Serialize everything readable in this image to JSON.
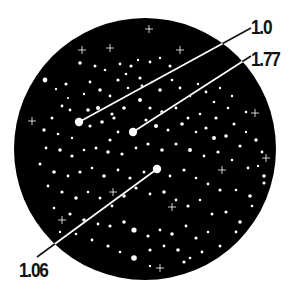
{
  "diagram": {
    "background": "#ffffff",
    "field": {
      "cx": 145,
      "cy": 149,
      "r": 131,
      "color": "#000000"
    },
    "star_color": "#ffffff",
    "line_color_outside": "#111111",
    "line_color_inside": "#ffffff",
    "callouts": [
      {
        "label": "1.0",
        "star": [
          79,
          122
        ],
        "anchor": [
          251,
          28
        ],
        "label_pos": [
          251,
          16
        ]
      },
      {
        "label": "1.77",
        "star": [
          133,
          132
        ],
        "anchor": [
          251,
          56
        ],
        "label_pos": [
          251,
          48
        ]
      },
      {
        "label": "1.06",
        "star": [
          157,
          169
        ],
        "anchor": [
          37,
          257
        ],
        "label_pos": [
          19,
          259
        ]
      }
    ],
    "highlight_stars": [
      [
        79,
        122,
        4.2
      ],
      [
        133,
        132,
        4.2
      ],
      [
        157,
        169,
        4.2
      ]
    ],
    "sparkles": [
      [
        149,
        29
      ],
      [
        110,
        48
      ],
      [
        180,
        50
      ],
      [
        82,
        50
      ],
      [
        32,
        121
      ],
      [
        62,
        220
      ],
      [
        172,
        207
      ],
      [
        255,
        113
      ],
      [
        113,
        192
      ],
      [
        222,
        170
      ],
      [
        266,
        158
      ],
      [
        160,
        268
      ]
    ],
    "stars": [
      [
        45,
        80,
        2.4
      ],
      [
        66,
        84,
        1.6
      ],
      [
        80,
        63,
        1.8
      ],
      [
        95,
        66,
        1.5
      ],
      [
        105,
        70,
        1.3
      ],
      [
        120,
        64,
        1.4
      ],
      [
        131,
        66,
        1.6
      ],
      [
        138,
        60,
        1.2
      ],
      [
        150,
        62,
        1.4
      ],
      [
        160,
        58,
        1.2
      ],
      [
        170,
        66,
        1.5
      ],
      [
        56,
        89,
        1.2
      ],
      [
        68,
        98,
        1.1
      ],
      [
        70,
        110,
        1.4
      ],
      [
        90,
        82,
        1.4
      ],
      [
        100,
        90,
        1.8
      ],
      [
        110,
        96,
        1.4
      ],
      [
        118,
        80,
        1.6
      ],
      [
        128,
        88,
        1.3
      ],
      [
        140,
        78,
        1.6
      ],
      [
        152,
        82,
        1.2
      ],
      [
        160,
        90,
        1.8
      ],
      [
        172,
        80,
        1.3
      ],
      [
        180,
        88,
        1.4
      ],
      [
        190,
        96,
        1.3
      ],
      [
        198,
        84,
        1.2
      ],
      [
        206,
        92,
        1.4
      ],
      [
        214,
        102,
        1.3
      ],
      [
        220,
        88,
        1.2
      ],
      [
        62,
        106,
        1.4
      ],
      [
        52,
        118,
        1.5
      ],
      [
        44,
        130,
        1.7
      ],
      [
        58,
        134,
        1.3
      ],
      [
        72,
        138,
        1.2
      ],
      [
        88,
        110,
        1.8
      ],
      [
        98,
        108,
        2.0
      ],
      [
        112,
        114,
        1.6
      ],
      [
        124,
        108,
        1.8
      ],
      [
        140,
        100,
        2.0
      ],
      [
        150,
        108,
        1.6
      ],
      [
        162,
        112,
        1.8
      ],
      [
        176,
        108,
        1.4
      ],
      [
        188,
        118,
        1.5
      ],
      [
        200,
        114,
        1.3
      ],
      [
        216,
        118,
        1.6
      ],
      [
        228,
        108,
        1.3
      ],
      [
        234,
        124,
        1.5
      ],
      [
        246,
        132,
        1.2
      ],
      [
        90,
        126,
        1.6
      ],
      [
        102,
        122,
        1.8
      ],
      [
        114,
        118,
        1.6
      ],
      [
        118,
        132,
        1.4
      ],
      [
        110,
        140,
        1.6
      ],
      [
        146,
        120,
        1.6
      ],
      [
        156,
        126,
        2.0
      ],
      [
        168,
        130,
        1.5
      ],
      [
        182,
        124,
        1.8
      ],
      [
        196,
        132,
        1.3
      ],
      [
        206,
        128,
        1.6
      ],
      [
        214,
        138,
        2.0
      ],
      [
        226,
        136,
        1.8
      ],
      [
        240,
        146,
        1.6
      ],
      [
        256,
        140,
        1.7
      ],
      [
        262,
        152,
        1.4
      ],
      [
        46,
        148,
        1.4
      ],
      [
        60,
        150,
        1.8
      ],
      [
        72,
        156,
        1.6
      ],
      [
        84,
        150,
        1.3
      ],
      [
        96,
        148,
        1.5
      ],
      [
        108,
        152,
        1.8
      ],
      [
        122,
        154,
        1.6
      ],
      [
        136,
        148,
        1.4
      ],
      [
        148,
        144,
        1.6
      ],
      [
        162,
        150,
        1.8
      ],
      [
        176,
        144,
        1.5
      ],
      [
        190,
        150,
        2.0
      ],
      [
        204,
        156,
        1.4
      ],
      [
        218,
        152,
        1.6
      ],
      [
        232,
        160,
        1.3
      ],
      [
        248,
        168,
        1.4
      ],
      [
        264,
        176,
        1.8
      ],
      [
        264,
        183,
        1.6
      ],
      [
        40,
        164,
        1.5
      ],
      [
        54,
        172,
        1.8
      ],
      [
        68,
        176,
        1.4
      ],
      [
        80,
        172,
        1.6
      ],
      [
        92,
        168,
        1.3
      ],
      [
        104,
        176,
        1.8
      ],
      [
        118,
        170,
        1.4
      ],
      [
        130,
        178,
        1.6
      ],
      [
        144,
        172,
        1.5
      ],
      [
        170,
        176,
        1.4
      ],
      [
        184,
        170,
        1.6
      ],
      [
        196,
        178,
        1.3
      ],
      [
        208,
        184,
        1.4
      ],
      [
        220,
        190,
        1.6
      ],
      [
        236,
        190,
        1.3
      ],
      [
        250,
        196,
        1.8
      ],
      [
        48,
        186,
        1.4
      ],
      [
        62,
        192,
        1.6
      ],
      [
        76,
        198,
        1.8
      ],
      [
        88,
        192,
        1.3
      ],
      [
        100,
        198,
        1.5
      ],
      [
        112,
        206,
        1.4
      ],
      [
        124,
        196,
        1.8
      ],
      [
        136,
        188,
        1.6
      ],
      [
        150,
        194,
        1.4
      ],
      [
        164,
        192,
        1.8
      ],
      [
        176,
        200,
        1.4
      ],
      [
        188,
        206,
        1.6
      ],
      [
        200,
        200,
        1.3
      ],
      [
        212,
        214,
        1.5
      ],
      [
        226,
        212,
        1.6
      ],
      [
        240,
        222,
        1.8
      ],
      [
        54,
        208,
        1.3
      ],
      [
        70,
        214,
        1.6
      ],
      [
        84,
        220,
        1.8
      ],
      [
        98,
        224,
        1.4
      ],
      [
        110,
        226,
        1.6
      ],
      [
        124,
        222,
        1.8
      ],
      [
        134,
        230,
        2.6
      ],
      [
        148,
        236,
        1.6
      ],
      [
        160,
        230,
        1.4
      ],
      [
        172,
        234,
        1.8
      ],
      [
        186,
        226,
        1.4
      ],
      [
        196,
        238,
        1.6
      ],
      [
        208,
        232,
        1.3
      ],
      [
        220,
        246,
        1.5
      ],
      [
        92,
        240,
        1.4
      ],
      [
        108,
        246,
        1.6
      ],
      [
        120,
        252,
        1.3
      ],
      [
        134,
        258,
        2.8
      ],
      [
        150,
        250,
        1.6
      ],
      [
        164,
        246,
        1.4
      ],
      [
        178,
        250,
        1.8
      ],
      [
        190,
        258,
        1.3
      ],
      [
        202,
        252,
        1.4
      ],
      [
        184,
        262,
        1.6
      ],
      [
        150,
        266,
        1.2
      ],
      [
        76,
        234,
        1.3
      ],
      [
        60,
        232,
        1.2
      ],
      [
        236,
        232,
        1.4
      ],
      [
        252,
        206,
        1.3
      ],
      [
        258,
        166,
        1.2
      ],
      [
        246,
        112,
        1.3
      ],
      [
        232,
        96,
        1.2
      ],
      [
        142,
        86,
        1.4
      ],
      [
        84,
        94,
        1.2
      ],
      [
        126,
        74,
        1.3
      ]
    ]
  }
}
